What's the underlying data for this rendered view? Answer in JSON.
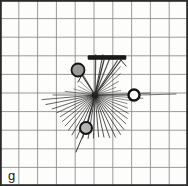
{
  "panel": {
    "label": "g",
    "width": 188,
    "height": 186,
    "background_color": "#fdfdfc",
    "border_color": "#2b2b2b"
  },
  "grid": {
    "columns": 10,
    "rows": 10,
    "line_color": "#8a8a8a",
    "minor_line_color": "#c9c9c9",
    "cell_width": 18.2,
    "cell_height": 17.9,
    "visible": true
  },
  "chart_data": {
    "type": "scatter",
    "title": "",
    "subtitle": "",
    "xlabel": "",
    "ylabel": "",
    "xlim": [
      0,
      188
    ],
    "ylim": [
      0,
      186
    ],
    "grid": true,
    "legend": "none",
    "annotations": [
      {
        "name": "panel-letter",
        "text": "g",
        "x": 10,
        "y": 176
      }
    ],
    "series": [
      {
        "name": "vertex-rays",
        "type": "rays",
        "origin": {
          "x": 95,
          "y": 95
        },
        "color": "#1c1c1c",
        "count": 42,
        "rays": [
          {
            "angle_deg": 271,
            "length": 40,
            "weight": 1.3
          },
          {
            "angle_deg": 281,
            "length": 41,
            "weight": 1.2
          },
          {
            "angle_deg": 292,
            "length": 42,
            "weight": 1.2
          },
          {
            "angle_deg": 303,
            "length": 41,
            "weight": 1.1
          },
          {
            "angle_deg": 312,
            "length": 38,
            "weight": 0.9
          },
          {
            "angle_deg": 320,
            "length": 33,
            "weight": 0.8
          },
          {
            "angle_deg": 330,
            "length": 27,
            "weight": 0.7
          },
          {
            "angle_deg": 340,
            "length": 22,
            "weight": 0.6
          },
          {
            "angle_deg": 350,
            "length": 26,
            "weight": 0.6
          },
          {
            "angle_deg": 358,
            "length": 55,
            "weight": 0.8
          },
          {
            "angle_deg": 4,
            "length": 48,
            "weight": 0.7
          },
          {
            "angle_deg": 9,
            "length": 38,
            "weight": 0.7
          },
          {
            "angle_deg": 15,
            "length": 33,
            "weight": 0.7
          },
          {
            "angle_deg": 22,
            "length": 35,
            "weight": 0.8
          },
          {
            "angle_deg": 29,
            "length": 38,
            "weight": 0.8
          },
          {
            "angle_deg": 36,
            "length": 40,
            "weight": 0.9
          },
          {
            "angle_deg": 43,
            "length": 42,
            "weight": 0.9
          },
          {
            "angle_deg": 50,
            "length": 45,
            "weight": 1.0
          },
          {
            "angle_deg": 57,
            "length": 47,
            "weight": 1.0
          },
          {
            "angle_deg": 64,
            "length": 47,
            "weight": 1.0
          },
          {
            "angle_deg": 71,
            "length": 45,
            "weight": 1.0
          },
          {
            "angle_deg": 78,
            "length": 43,
            "weight": 1.0
          },
          {
            "angle_deg": 85,
            "length": 42,
            "weight": 1.0
          },
          {
            "angle_deg": 92,
            "length": 43,
            "weight": 1.0
          },
          {
            "angle_deg": 99,
            "length": 44,
            "weight": 1.0
          },
          {
            "angle_deg": 106,
            "length": 45,
            "weight": 1.0
          },
          {
            "angle_deg": 113,
            "length": 47,
            "weight": 1.0
          },
          {
            "angle_deg": 120,
            "length": 46,
            "weight": 1.0
          },
          {
            "angle_deg": 127,
            "length": 44,
            "weight": 0.9
          },
          {
            "angle_deg": 134,
            "length": 43,
            "weight": 0.9
          },
          {
            "angle_deg": 141,
            "length": 42,
            "weight": 0.9
          },
          {
            "angle_deg": 148,
            "length": 41,
            "weight": 0.9
          },
          {
            "angle_deg": 155,
            "length": 42,
            "weight": 0.9
          },
          {
            "angle_deg": 162,
            "length": 45,
            "weight": 0.9
          },
          {
            "angle_deg": 169,
            "length": 50,
            "weight": 0.9
          },
          {
            "angle_deg": 175,
            "length": 53,
            "weight": 0.9
          },
          {
            "angle_deg": 180,
            "length": 42,
            "weight": 0.8
          },
          {
            "angle_deg": 187,
            "length": 30,
            "weight": 0.7
          },
          {
            "angle_deg": 196,
            "length": 22,
            "weight": 0.6
          },
          {
            "angle_deg": 208,
            "length": 19,
            "weight": 0.6
          },
          {
            "angle_deg": 222,
            "length": 21,
            "weight": 0.6
          },
          {
            "angle_deg": 240,
            "length": 26,
            "weight": 0.7
          }
        ]
      },
      {
        "name": "markers",
        "type": "circles",
        "points": [
          {
            "id": "marker-upper-left",
            "x": 78,
            "y": 70,
            "r": 6.5,
            "fill": "#9a9a9a",
            "stroke": "#141414",
            "stroke_width": 1.8,
            "filled": true
          },
          {
            "id": "marker-right",
            "x": 134,
            "y": 95,
            "r": 5.5,
            "fill": "#ffffff",
            "stroke": "#141414",
            "stroke_width": 2.4,
            "filled": false
          },
          {
            "id": "marker-lower",
            "x": 86,
            "y": 128,
            "r": 6.0,
            "fill": "#b4b4b4",
            "stroke": "#141414",
            "stroke_width": 2.0,
            "filled": true
          }
        ]
      },
      {
        "name": "horizontal-bar",
        "type": "bar",
        "x1": 88,
        "x2": 126,
        "y": 57.5,
        "thickness": 4.0,
        "color": "#1a1a1a"
      },
      {
        "name": "connector-tracks",
        "type": "lines",
        "color": "#2a2a2a",
        "lines": [
          {
            "id": "track-to-bar-left",
            "x1": 95,
            "y1": 95,
            "x2": 104,
            "y2": 60,
            "weight": 1.2
          },
          {
            "id": "track-to-bar-right",
            "x1": 95,
            "y1": 95,
            "x2": 121,
            "y2": 60,
            "weight": 1.2
          },
          {
            "id": "track-bar-kink",
            "x1": 121,
            "y1": 60,
            "x2": 126,
            "y2": 66,
            "weight": 1.0
          },
          {
            "id": "track-to-upper-left-marker",
            "x1": 95,
            "y1": 95,
            "x2": 82,
            "y2": 75,
            "weight": 1.3
          },
          {
            "id": "track-upper-left-stub",
            "x1": 82,
            "y1": 75,
            "x2": 78,
            "y2": 82,
            "weight": 1.0
          },
          {
            "id": "track-to-lower-marker",
            "x1": 95,
            "y1": 95,
            "x2": 88,
            "y2": 122,
            "weight": 1.1
          },
          {
            "id": "track-lower-tail",
            "x1": 84,
            "y1": 133,
            "x2": 76,
            "y2": 152,
            "weight": 1.0
          },
          {
            "id": "track-to-right-marker",
            "x1": 95,
            "y1": 95,
            "x2": 128,
            "y2": 95,
            "weight": 1.0
          },
          {
            "id": "track-right-exit",
            "x1": 140,
            "y1": 95,
            "x2": 176,
            "y2": 94,
            "weight": 0.7
          }
        ]
      }
    ]
  }
}
